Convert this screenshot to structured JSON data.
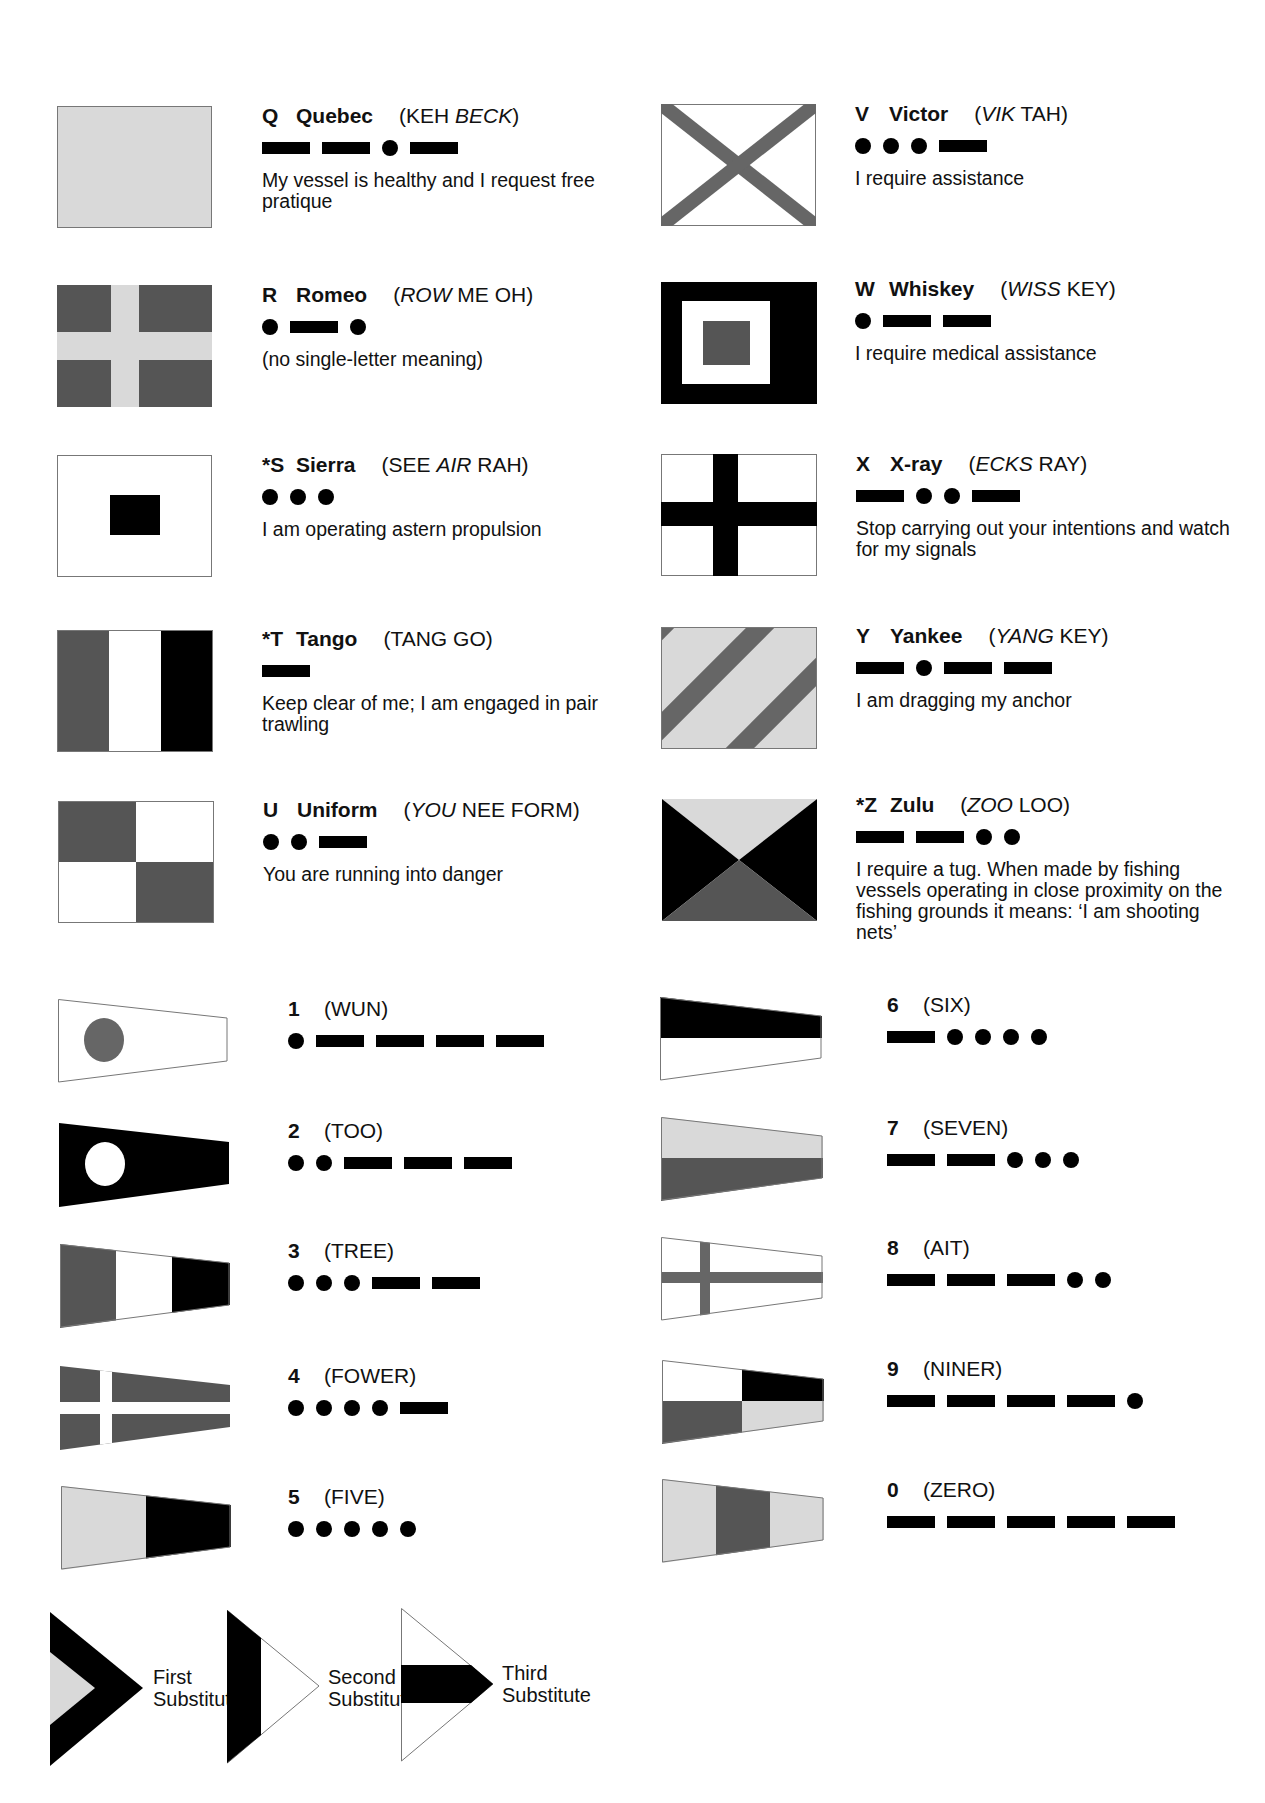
{
  "colors": {
    "black": "#000000",
    "dark_gray": "#555555",
    "light_gray": "#d9d9d9",
    "white": "#ffffff",
    "border": "#777777"
  },
  "letters": [
    {
      "code": "Q",
      "name": "Quebec",
      "pron_pre": "(KEH ",
      "pron_italic": "BECK",
      "pron_post": ")",
      "morse": "--.-",
      "meaning": "My vessel is healthy and I request free pratique"
    },
    {
      "code": "R",
      "name": "Romeo",
      "pron_pre": "(",
      "pron_italic": "ROW",
      "pron_post": " ME OH)",
      "morse": ".-.",
      "meaning": "(no single-letter meaning)"
    },
    {
      "code": "*S",
      "name": "Sierra",
      "pron_pre": "(SEE ",
      "pron_italic": "AIR",
      "pron_post": " RAH)",
      "morse": "...",
      "meaning": "I am operating astern propulsion"
    },
    {
      "code": "*T",
      "name": "Tango",
      "pron_pre": "(TANG GO)",
      "pron_italic": "",
      "pron_post": "",
      "morse": "-",
      "meaning": "Keep clear of me; I am engaged in pair trawling"
    },
    {
      "code": "U",
      "name": "Uniform",
      "pron_pre": "(",
      "pron_italic": "YOU",
      "pron_post": " NEE FORM)",
      "morse": "..-",
      "meaning": "You are running into danger"
    },
    {
      "code": "V",
      "name": "Victor",
      "pron_pre": "(",
      "pron_italic": "VIK",
      "pron_post": " TAH)",
      "morse": "...-",
      "meaning": "I require assistance"
    },
    {
      "code": "W",
      "name": "Whiskey",
      "pron_pre": "(",
      "pron_italic": "WISS",
      "pron_post": " KEY)",
      "morse": ".--",
      "meaning": "I require medical assistance"
    },
    {
      "code": "X",
      "name": "X-ray",
      "pron_pre": "(",
      "pron_italic": "ECKS",
      "pron_post": " RAY)",
      "morse": "-..-",
      "meaning": "Stop carrying out your intentions and watch for my signals"
    },
    {
      "code": "Y",
      "name": "Yankee",
      "pron_pre": "(",
      "pron_italic": "YANG",
      "pron_post": " KEY)",
      "morse": "-.--",
      "meaning": "I am dragging my anchor"
    },
    {
      "code": "*Z",
      "name": "Zulu",
      "pron_pre": "(",
      "pron_italic": "ZOO",
      "pron_post": " LOO)",
      "morse": "--..",
      "meaning": "I require a tug. When made by fishing vessels operating in close proximity on the fishing grounds it means: ‘I am shooting nets’"
    }
  ],
  "numerals": [
    {
      "code": "1",
      "pron": "(WUN)",
      "morse": ".----"
    },
    {
      "code": "2",
      "pron": "(TOO)",
      "morse": "..---"
    },
    {
      "code": "3",
      "pron": "(TREE)",
      "morse": "...--"
    },
    {
      "code": "4",
      "pron": "(FOWER)",
      "morse": "....-"
    },
    {
      "code": "5",
      "pron": "(FIVE)",
      "morse": "....."
    },
    {
      "code": "6",
      "pron": "(SIX)",
      "morse": "-...."
    },
    {
      "code": "7",
      "pron": "(SEVEN)",
      "morse": "--..."
    },
    {
      "code": "8",
      "pron": "(AIT)",
      "morse": "---.."
    },
    {
      "code": "9",
      "pron": "(NINER)",
      "morse": "----."
    },
    {
      "code": "0",
      "pron": "(ZERO)",
      "morse": "-----"
    }
  ],
  "substitutes": [
    {
      "line1": "First",
      "line2": "Substitute"
    },
    {
      "line1": "Second",
      "line2": "Substitute"
    },
    {
      "line1": "Third",
      "line2": "Substitute"
    }
  ]
}
